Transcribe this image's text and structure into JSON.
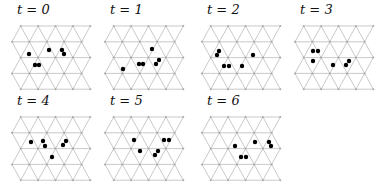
{
  "panels": [
    {
      "label": "t = 0",
      "x": 0,
      "y": 0,
      "particles": [
        [
          29,
          54
        ],
        [
          49,
          50
        ],
        [
          62,
          50
        ],
        [
          64,
          54
        ],
        [
          35,
          65
        ],
        [
          39,
          65
        ]
      ]
    },
    {
      "label": "t = 1",
      "x": 93,
      "y": 0,
      "particles": [
        [
          123,
          69
        ],
        [
          139,
          64
        ],
        [
          143,
          64
        ],
        [
          152,
          49
        ],
        [
          156,
          64
        ],
        [
          159,
          60
        ]
      ]
    },
    {
      "label": "t = 2",
      "x": 190,
      "y": 0,
      "particles": [
        [
          217,
          55
        ],
        [
          219,
          51
        ],
        [
          224,
          66
        ],
        [
          229,
          66
        ],
        [
          242,
          66
        ],
        [
          253,
          55
        ]
      ]
    },
    {
      "label": "t = 3",
      "x": 283,
      "y": 0,
      "particles": [
        [
          313,
          51
        ],
        [
          318,
          51
        ],
        [
          313,
          61
        ],
        [
          333,
          65
        ],
        [
          346,
          65
        ],
        [
          349,
          61
        ]
      ]
    },
    {
      "label": "t = 4",
      "x": 0,
      "y": 91,
      "particles": [
        [
          31,
          142
        ],
        [
          43,
          141
        ],
        [
          45,
          146
        ],
        [
          63,
          145
        ],
        [
          66,
          141
        ],
        [
          52,
          157
        ]
      ]
    },
    {
      "label": "t = 5",
      "x": 93,
      "y": 91,
      "particles": [
        [
          134,
          140
        ],
        [
          140,
          151
        ],
        [
          155,
          155
        ],
        [
          158,
          151
        ],
        [
          164,
          140
        ],
        [
          169,
          140
        ]
      ]
    },
    {
      "label": "t = 6",
      "x": 190,
      "y": 91,
      "particles": [
        [
          235,
          146
        ],
        [
          241,
          157
        ],
        [
          246,
          157
        ],
        [
          255,
          142
        ],
        [
          269,
          142
        ],
        [
          271,
          146
        ]
      ]
    }
  ]
}
